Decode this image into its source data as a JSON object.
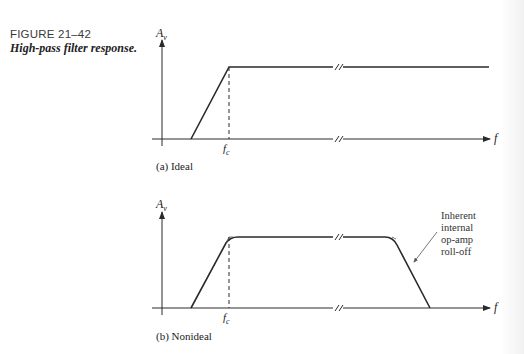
{
  "figure": {
    "number": "FIGURE 21–42",
    "title": "High-pass filter response."
  },
  "panels": [
    {
      "id": "a",
      "caption": "(a) Ideal",
      "y_axis_label": "A",
      "y_axis_subscript": "v",
      "x_axis_label": "f",
      "cutoff_label": "f",
      "cutoff_subscript": "c"
    },
    {
      "id": "b",
      "caption": "(b) Nonideal",
      "y_axis_label": "A",
      "y_axis_subscript": "v",
      "x_axis_label": "f",
      "cutoff_label": "f",
      "cutoff_subscript": "c",
      "annotation": [
        "Inherent",
        "internal",
        "op-amp",
        "roll-off"
      ]
    }
  ],
  "colors": {
    "line": "#2a2a2a",
    "text": "#222222"
  }
}
